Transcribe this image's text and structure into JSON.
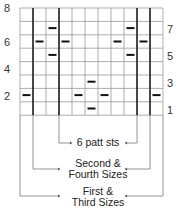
{
  "chart": {
    "columns": 11,
    "rows": 8,
    "row_labels_left": [
      "8",
      "6",
      "4",
      "2"
    ],
    "row_labels_right": [
      "7",
      "5",
      "3",
      "1"
    ],
    "purl_marks": [
      {
        "row": 7,
        "col": 2
      },
      {
        "row": 7,
        "col": 8
      },
      {
        "row": 6,
        "col": 1
      },
      {
        "row": 6,
        "col": 3
      },
      {
        "row": 6,
        "col": 7
      },
      {
        "row": 6,
        "col": 9
      },
      {
        "row": 5,
        "col": 2
      },
      {
        "row": 5,
        "col": 8
      },
      {
        "row": 3,
        "col": 5
      },
      {
        "row": 2,
        "col": 0
      },
      {
        "row": 2,
        "col": 4
      },
      {
        "row": 2,
        "col": 6
      },
      {
        "row": 2,
        "col": 10
      },
      {
        "row": 1,
        "col": 5
      }
    ]
  },
  "brackets": {
    "repeat": "6 patt sts",
    "second_fourth_line1": "Second &",
    "second_fourth_line2": "Fourth Sizes",
    "first_third_line1": "First &",
    "first_third_line2": "Third Sizes"
  }
}
